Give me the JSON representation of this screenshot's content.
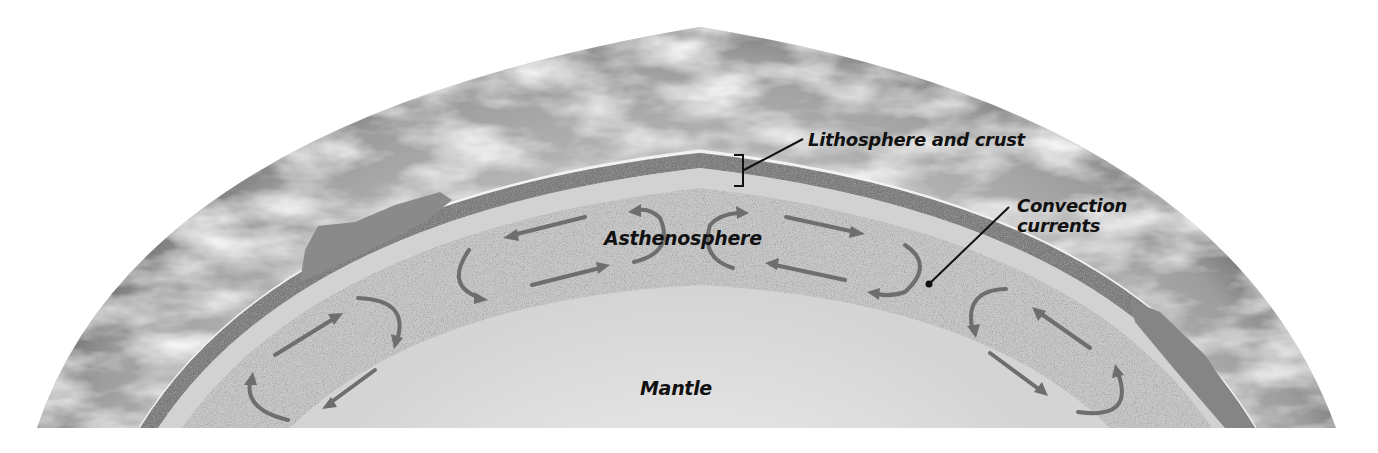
{
  "diagram": {
    "labels": {
      "lithosphere": "Lithosphere and crust",
      "convection_line1": "Convection",
      "convection_line2": "currents",
      "asthenosphere": "Asthenosphere",
      "mantle": "Mantle"
    },
    "layers": [
      {
        "name": "atmosphere-surface",
        "color": "#9a9a9a"
      },
      {
        "name": "lithosphere-and-crust",
        "color": "#7d7d7d"
      },
      {
        "name": "asthenosphere",
        "color": "#c4c4c4"
      },
      {
        "name": "mantle",
        "color": "#dcdcdc"
      }
    ],
    "arrow_color": "#6e6e6e",
    "leader_line_color": "#111111"
  }
}
